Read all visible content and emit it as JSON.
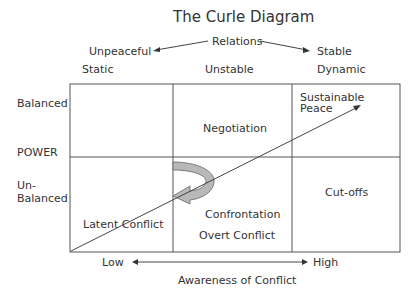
{
  "title": "The Curle Diagram",
  "relations": {
    "label": "Relations",
    "left_top": "Unpeaceful",
    "left_bottom": "Static",
    "middle": "Unstable",
    "right_top": "Stable",
    "right_bottom": "Dynamic"
  },
  "power_axis": {
    "top": "Balanced",
    "label": "POWER",
    "bottom_line1": "Un-",
    "bottom_line2": "Balanced"
  },
  "cells": {
    "top_middle": "Negotiation",
    "top_right_line1": "Sustainable",
    "top_right_line2": "Peace",
    "bottom_left": "Latent Conflict",
    "bottom_middle_1": "Confrontation",
    "bottom_middle_2": "Overt Conflict",
    "bottom_right": "Cut-offs"
  },
  "awareness_axis": {
    "low": "Low",
    "high": "High",
    "label": "Awareness of Conflict"
  },
  "colors": {
    "line": "#444444",
    "curved_arrow_fill": "#b8b8b8"
  }
}
